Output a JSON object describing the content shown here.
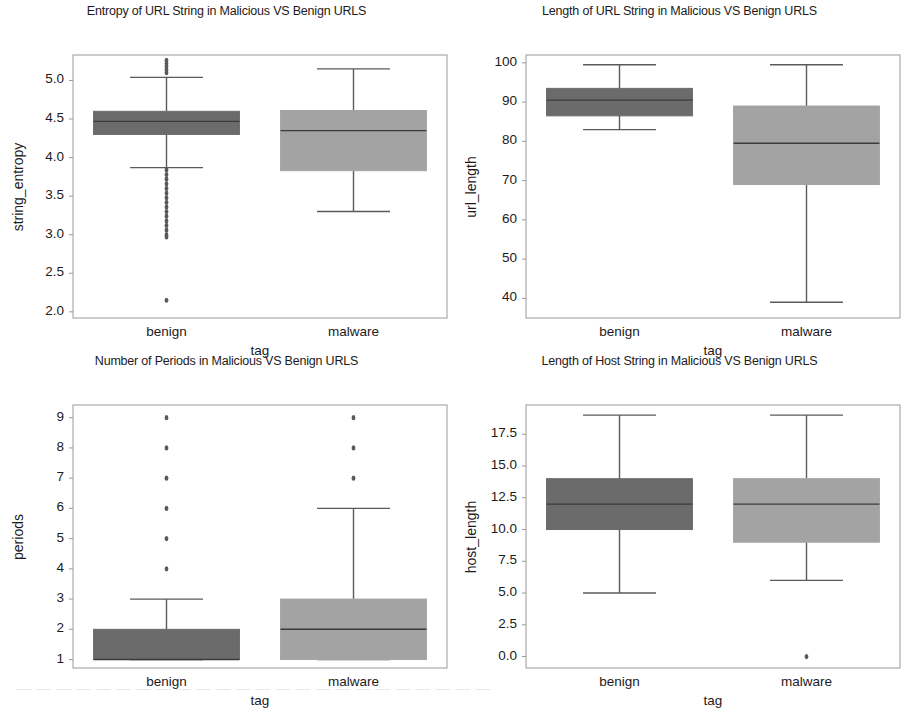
{
  "figure": {
    "width": 906,
    "height": 707,
    "background": "#ffffff",
    "benign_color": "#6b6b6b",
    "malware_color": "#a3a3a3",
    "line_color": "#5a5a5a",
    "frame_color": "#9a9a9a",
    "text_color": "#1d1a1b"
  },
  "bleed_text": "— — — — — — — — — — — — — — — — — — — — — — — —",
  "chart_data": [
    {
      "type": "box",
      "title": "Entropy of URL String in Malicious VS Benign URLS",
      "xlabel": "tag",
      "ylabel": "string_entropy",
      "categories": [
        "benign",
        "malware"
      ],
      "ylim": [
        1.92,
        5.33
      ],
      "yticks": [
        2.0,
        2.5,
        3.0,
        3.5,
        4.0,
        4.5,
        5.0
      ],
      "ytick_labels": [
        "2.0",
        "2.5",
        "3.0",
        "3.5",
        "4.0",
        "4.5",
        "5.0"
      ],
      "grid": false,
      "boxes": [
        {
          "name": "benign",
          "color": "#6b6b6b",
          "whisker_low": 3.87,
          "q1": 4.3,
          "median": 4.47,
          "q3": 4.6,
          "whisker_high": 5.04,
          "outliers": [
            5.26,
            5.22,
            5.18,
            5.14,
            5.1,
            3.84,
            3.78,
            3.72,
            3.66,
            3.6,
            3.54,
            3.48,
            3.42,
            3.36,
            3.3,
            3.24,
            3.18,
            3.12,
            3.06,
            3.0,
            2.97,
            2.15
          ]
        },
        {
          "name": "malware",
          "color": "#a3a3a3",
          "whisker_low": 3.3,
          "q1": 3.83,
          "median": 4.35,
          "q3": 4.61,
          "whisker_high": 5.15,
          "outliers": []
        }
      ]
    },
    {
      "type": "box",
      "title": "Length of URL String in Malicious VS Benign URLS",
      "xlabel": "tag",
      "ylabel": "url_length",
      "categories": [
        "benign",
        "malware"
      ],
      "ylim": [
        35.0,
        102.0
      ],
      "yticks": [
        40,
        50,
        60,
        70,
        80,
        90,
        100
      ],
      "ytick_labels": [
        "40",
        "50",
        "60",
        "70",
        "80",
        "90",
        "100"
      ],
      "grid": false,
      "boxes": [
        {
          "name": "benign",
          "color": "#6b6b6b",
          "whisker_low": 83.0,
          "q1": 86.5,
          "median": 90.5,
          "q3": 93.5,
          "whisker_high": 99.5,
          "outliers": []
        },
        {
          "name": "malware",
          "color": "#a3a3a3",
          "whisker_low": 39.0,
          "q1": 69.0,
          "median": 79.5,
          "q3": 89.0,
          "whisker_high": 99.5,
          "outliers": []
        }
      ]
    },
    {
      "type": "box",
      "title": "Number of Periods in Malicious VS Benign URLS",
      "xlabel": "tag",
      "ylabel": "periods",
      "categories": [
        "benign",
        "malware"
      ],
      "ylim": [
        0.72,
        9.42
      ],
      "yticks": [
        1,
        2,
        3,
        4,
        5,
        6,
        7,
        8,
        9
      ],
      "ytick_labels": [
        "1",
        "2",
        "3",
        "4",
        "5",
        "6",
        "7",
        "8",
        "9"
      ],
      "grid": false,
      "boxes": [
        {
          "name": "benign",
          "color": "#6b6b6b",
          "whisker_low": 1.0,
          "q1": 1.0,
          "median": 1.0,
          "q3": 2.0,
          "whisker_high": 3.0,
          "outliers": [
            4,
            5,
            6,
            7,
            8,
            9
          ]
        },
        {
          "name": "malware",
          "color": "#a3a3a3",
          "whisker_low": 1.0,
          "q1": 1.0,
          "median": 2.0,
          "q3": 3.0,
          "whisker_high": 6.0,
          "outliers": [
            7,
            8,
            9
          ]
        }
      ]
    },
    {
      "type": "box",
      "title": "Length of Host String in Malicious VS Benign URLS",
      "xlabel": "tag",
      "ylabel": "host_length",
      "categories": [
        "benign",
        "malware"
      ],
      "ylim": [
        -0.9,
        19.8
      ],
      "yticks": [
        0.0,
        2.5,
        5.0,
        7.5,
        10.0,
        12.5,
        15.0,
        17.5
      ],
      "ytick_labels": [
        "0.0",
        "2.5",
        "5.0",
        "7.5",
        "10.0",
        "12.5",
        "15.0",
        "17.5"
      ],
      "grid": false,
      "boxes": [
        {
          "name": "benign",
          "color": "#6b6b6b",
          "whisker_low": 5.0,
          "q1": 10.0,
          "median": 12.0,
          "q3": 14.0,
          "whisker_high": 19.0,
          "outliers": []
        },
        {
          "name": "malware",
          "color": "#a3a3a3",
          "whisker_low": 6.0,
          "q1": 9.0,
          "median": 12.0,
          "q3": 14.0,
          "whisker_high": 19.0,
          "outliers": [
            0.0
          ]
        }
      ]
    }
  ]
}
